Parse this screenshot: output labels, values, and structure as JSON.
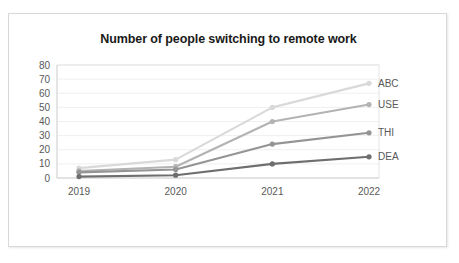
{
  "chart_data": {
    "type": "line",
    "title": "Number of people switching to remote work",
    "xlabel": "",
    "ylabel": "",
    "categories": [
      "2019",
      "2020",
      "2021",
      "2022"
    ],
    "x": [
      2019,
      2020,
      2021,
      2022
    ],
    "ylim": [
      0,
      80
    ],
    "yticks": [
      0,
      10,
      20,
      30,
      40,
      50,
      60,
      70,
      80
    ],
    "ytick_labels": [
      "0",
      "10",
      "20",
      "30",
      "40",
      "50",
      "60",
      "70",
      "80"
    ],
    "grid": true,
    "legend_position": "right-of-line-end",
    "series": [
      {
        "name": "ABC",
        "values": [
          7,
          13,
          50,
          67
        ],
        "color": "#d9d9d9"
      },
      {
        "name": "USE",
        "values": [
          5,
          8,
          40,
          52
        ],
        "color": "#b3b3b3"
      },
      {
        "name": "THI",
        "values": [
          4,
          6,
          24,
          32
        ],
        "color": "#949494"
      },
      {
        "name": "DEA",
        "values": [
          1,
          2,
          10,
          15
        ],
        "color": "#6e6e6e"
      }
    ]
  },
  "labels": {
    "y_ticks": [
      "80",
      "70",
      "60",
      "50",
      "40",
      "30",
      "20",
      "10",
      "0"
    ],
    "x_ticks": [
      "2019",
      "2020",
      "2021",
      "2022"
    ],
    "series_names": [
      "ABC",
      "USE",
      "THI",
      "DEA"
    ]
  }
}
